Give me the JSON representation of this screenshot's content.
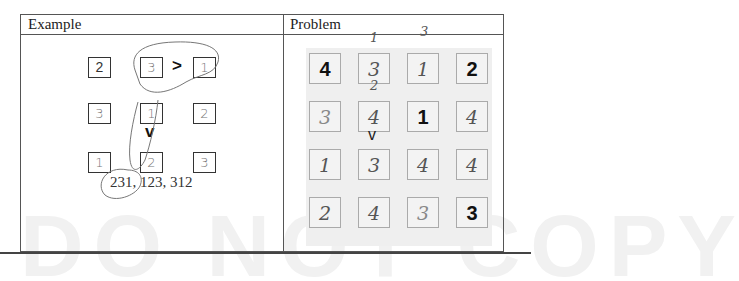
{
  "watermark": "DO NOT COPY",
  "table": {
    "headers": [
      "Example",
      "Problem"
    ]
  },
  "example": {
    "cells": [
      {
        "row": 0,
        "col": 0,
        "value": "2",
        "style": "printed"
      },
      {
        "row": 0,
        "col": 1,
        "value": "3",
        "style": "handwritten"
      },
      {
        "row": 0,
        "col": 2,
        "value": "1",
        "style": "handwritten"
      },
      {
        "row": 1,
        "col": 0,
        "value": "3",
        "style": "handwritten"
      },
      {
        "row": 1,
        "col": 1,
        "value": "1",
        "style": "handwritten"
      },
      {
        "row": 1,
        "col": 2,
        "value": "2",
        "style": "handwritten"
      },
      {
        "row": 2,
        "col": 0,
        "value": "1",
        "style": "handwritten"
      },
      {
        "row": 2,
        "col": 1,
        "value": "2",
        "style": "handwritten"
      },
      {
        "row": 2,
        "col": 2,
        "value": "3",
        "style": "handwritten"
      }
    ],
    "greater_than": ">",
    "down_symbol": "v",
    "answers": "231, 123, 312"
  },
  "problem": {
    "cells": [
      [
        "4",
        "3",
        "1",
        "2"
      ],
      [
        "3",
        "4",
        "1",
        "4"
      ],
      [
        "1",
        "3",
        "4",
        "4"
      ],
      [
        "2",
        "4",
        "3",
        "3"
      ]
    ],
    "given": [
      [
        true,
        false,
        false,
        true
      ],
      [
        false,
        false,
        true,
        false
      ],
      [
        false,
        false,
        false,
        false
      ],
      [
        false,
        false,
        false,
        true
      ]
    ],
    "annotations": {
      "above_r0c1": "1",
      "above_r0c2": "3",
      "above_r1c1": "2"
    },
    "down_symbol": "v"
  }
}
